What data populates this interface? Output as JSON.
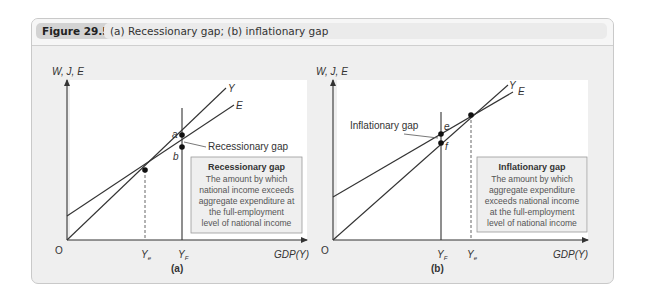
{
  "figure": {
    "number": "Figure 29.5",
    "title": "(a) Recessionary gap; (b) inflationary gap"
  },
  "panel_a": {
    "label": "(a)",
    "y_axis_label": "W, J, E",
    "x_axis_label": "GDP(Y)",
    "origin_label": "O",
    "line_y_label": "Y",
    "line_e_label": "E",
    "point_a_label": "a",
    "point_b_label": "b",
    "ye_label": "Y",
    "ye_sub": "e",
    "yf_label": "Y",
    "yf_sub": "F",
    "gap_callout": "Recessionary gap",
    "box_title": "Recessionary gap",
    "box_lines": [
      "The amount by which",
      "national income exceeds",
      "aggregate expenditure at",
      "the full-employment",
      "level of national income"
    ]
  },
  "panel_b": {
    "label": "(b)",
    "y_axis_label": "W, J, E",
    "x_axis_label": "GDP(Y)",
    "origin_label": "O",
    "line_y_label": "Y",
    "line_e_label": "E",
    "point_e_label": "e",
    "point_f_label": "f",
    "ye_label": "Y",
    "ye_sub": "e",
    "yf_label": "Y",
    "yf_sub": "F",
    "gap_callout": "Inflationary gap",
    "box_title": "Inflationary gap",
    "box_lines": [
      "The amount by which",
      "aggregate expenditure",
      "exceeds national income",
      "at the full-employment",
      "level of national income"
    ]
  },
  "colors": {
    "frame_bg": "#efefef",
    "plot_bg": "#ffffff",
    "line": "#333333",
    "box_bg": "#efefef",
    "box_border": "#9a9a9a"
  }
}
